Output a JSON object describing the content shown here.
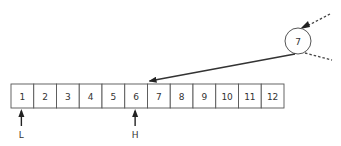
{
  "array": {
    "cells": [
      "1",
      "2",
      "3",
      "4",
      "5",
      "6",
      "7",
      "8",
      "9",
      "10",
      "11",
      "12"
    ],
    "x": 11,
    "y": 84,
    "cell_width": 22.75,
    "cell_height": 24
  },
  "pointers": [
    {
      "label": "L",
      "cell_index": 0
    },
    {
      "label": "H",
      "cell_index": 5
    }
  ],
  "node": {
    "value": "7",
    "cx": 298,
    "cy": 41,
    "r": 13
  },
  "arrow_target_cell_index": 6,
  "colors": {
    "stroke": "#555555",
    "text": "#333333"
  }
}
